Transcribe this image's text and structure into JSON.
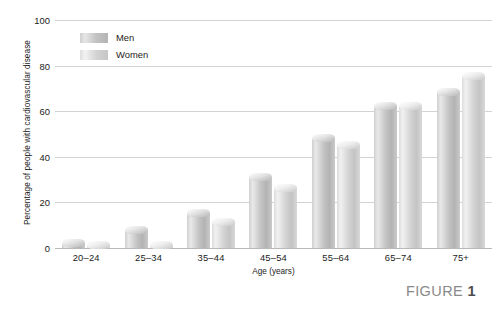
{
  "figure": {
    "caption_prefix": "FIGURE",
    "caption_number": "1"
  },
  "legend": {
    "items": [
      {
        "label": "Men",
        "color": "#c2c2c2"
      },
      {
        "label": "Women",
        "color": "#d6d6d6"
      }
    ]
  },
  "chart_data": {
    "type": "bar",
    "title": "",
    "subtitle": "",
    "xlabel": "Age (years)",
    "ylabel": "Percentage of people with cardiovascular disease",
    "categories": [
      "20–24",
      "25–34",
      "35–44",
      "45–54",
      "55–64",
      "65–74",
      "75+"
    ],
    "series": [
      {
        "name": "Men",
        "values": [
          4,
          9.5,
          17,
          33,
          50,
          64,
          70
        ]
      },
      {
        "name": "Women",
        "values": [
          3,
          3,
          13,
          28,
          47,
          64,
          77
        ]
      }
    ],
    "ylim": [
      0,
      100
    ],
    "yticks": [
      0,
      20,
      40,
      60,
      80,
      100
    ],
    "ytick_labels": [
      "0",
      "20",
      "40",
      "60",
      "80",
      "100"
    ],
    "grid": true,
    "grid_axis": "y",
    "legend_position": "inside-top-left",
    "bar_orientation": "vertical",
    "bar_style": "3d-cylinder"
  }
}
